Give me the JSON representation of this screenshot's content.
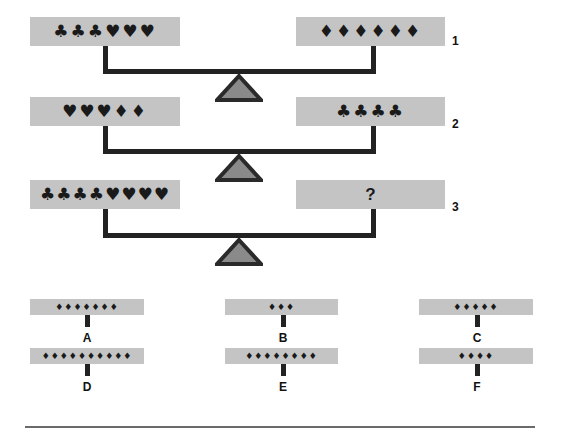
{
  "puzzle": {
    "scales": [
      {
        "number": "1",
        "left": "♣♣♣♥♥♥",
        "right": "♦♦♦♦♦♦"
      },
      {
        "number": "2",
        "left": "♥♥♥♦♦",
        "right": "♣♣♣♣"
      },
      {
        "number": "3",
        "left": "♣♣♣♣♥♥♥♥",
        "right": "?"
      }
    ],
    "options": [
      {
        "label": "A",
        "symbols": "♦♦♦♦♦♦♦",
        "count": 7
      },
      {
        "label": "B",
        "symbols": "♦♦♦",
        "count": 3
      },
      {
        "label": "C",
        "symbols": "♦♦♦♦♦",
        "count": 5
      },
      {
        "label": "D",
        "symbols": "♦♦♦♦♦♦♦♦♦♦",
        "count": 10
      },
      {
        "label": "E",
        "symbols": "♦♦♦♦♦♦♦♦",
        "count": 8
      },
      {
        "label": "F",
        "symbols": "♦♦♦♦",
        "count": 4
      }
    ]
  },
  "colors": {
    "pan": "#c4c4c4",
    "beam": "#222222",
    "fulcrum_fill": "#8a8a8a",
    "fulcrum_border": "#2a2a2a"
  }
}
